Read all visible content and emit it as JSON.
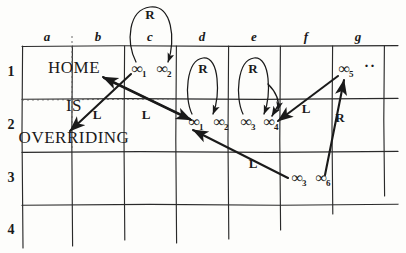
{
  "diagram": {
    "ink_color": "#1a1a1a",
    "grid": {
      "column_headers": [
        "a",
        "b",
        "c",
        "d",
        "e",
        "f",
        "g"
      ],
      "row_headers": [
        "1",
        "2",
        "3",
        "4"
      ],
      "column_x": [
        47,
        98,
        150,
        202,
        254,
        306,
        358
      ],
      "row_y": [
        72,
        125,
        178,
        230
      ],
      "vline_x": [
        22,
        72,
        124,
        176,
        228,
        280,
        332,
        384
      ],
      "hline_y": [
        46,
        99,
        152,
        205
      ],
      "vline_top": 46,
      "vline_bottom": 248,
      "hline_left": 22,
      "hline_right": 398
    },
    "cells": [
      {
        "name": "home",
        "text": "HOME",
        "x": 74,
        "y": 67
      },
      {
        "name": "is",
        "text": "IS",
        "x": 74,
        "y": 105
      },
      {
        "name": "overriding",
        "text": "OVERRIDING",
        "x": 74,
        "y": 137
      }
    ],
    "tokens": [
      {
        "name": "token-inf-1-row1",
        "symbol": "∞",
        "subscript": "1",
        "x": 139,
        "y": 70
      },
      {
        "name": "token-inf-2-row1",
        "symbol": "∞",
        "subscript": "2",
        "x": 164,
        "y": 70
      },
      {
        "name": "token-inf-1-row2",
        "symbol": "∞",
        "subscript": "1",
        "x": 196,
        "y": 123
      },
      {
        "name": "token-inf-2-row2",
        "symbol": "∞",
        "subscript": "2",
        "x": 221,
        "y": 123
      },
      {
        "name": "token-inf-3-row2",
        "symbol": "∞",
        "subscript": "3",
        "x": 248,
        "y": 123
      },
      {
        "name": "token-inf-4-row2",
        "symbol": "∞",
        "subscript": "4",
        "x": 271,
        "y": 123
      },
      {
        "name": "token-inf-5-row1",
        "symbol": "∞",
        "subscript": "5",
        "x": 346,
        "y": 70
      },
      {
        "name": "token-inf-3-row3",
        "symbol": "∞",
        "subscript": "3",
        "x": 299,
        "y": 179
      },
      {
        "name": "token-inf-6-row3",
        "symbol": "∞",
        "subscript": "6",
        "x": 323,
        "y": 179
      }
    ],
    "ellipsis": {
      "name": "continuation-dots",
      "text": "··",
      "x": 370,
      "y": 66
    },
    "move_labels": [
      {
        "name": "move-label-R-c",
        "text": "R",
        "x": 150,
        "y": 14
      },
      {
        "name": "move-label-R-d",
        "text": "R",
        "x": 203,
        "y": 68
      },
      {
        "name": "move-label-R-e",
        "text": "R",
        "x": 253,
        "y": 68
      },
      {
        "name": "move-label-L-left",
        "text": "L",
        "x": 97,
        "y": 114
      },
      {
        "name": "move-label-L-mid",
        "text": "L",
        "x": 146,
        "y": 114
      },
      {
        "name": "move-label-L-right",
        "text": "L",
        "x": 306,
        "y": 108
      },
      {
        "name": "move-label-R-right",
        "text": "R",
        "x": 340,
        "y": 117
      },
      {
        "name": "move-label-L-lower",
        "text": "L",
        "x": 253,
        "y": 163
      }
    ],
    "loops": [
      {
        "name": "loop-arc-c",
        "label": "R"
      },
      {
        "name": "loop-arc-d",
        "label": "R"
      },
      {
        "name": "loop-arc-e",
        "label": "R"
      }
    ],
    "arrows": [
      {
        "name": "arrow-transition-down-c",
        "move": "R"
      },
      {
        "name": "arrow-transition-down-d",
        "move": "R"
      },
      {
        "name": "arrow-transition-down-e",
        "move": "R"
      },
      {
        "name": "arrow-transition-left-overriding",
        "move": "L"
      },
      {
        "name": "arrow-transition-up-home",
        "move": "L"
      },
      {
        "name": "arrow-transition-down-right",
        "move": "L"
      },
      {
        "name": "arrow-transition-left-row2",
        "move": "L"
      },
      {
        "name": "arrow-transition-up-inf5",
        "move": "R"
      }
    ],
    "dotted_guides": [
      {
        "name": "dotted-guide-vertical"
      },
      {
        "name": "dotted-guide-horizontal"
      }
    ]
  }
}
